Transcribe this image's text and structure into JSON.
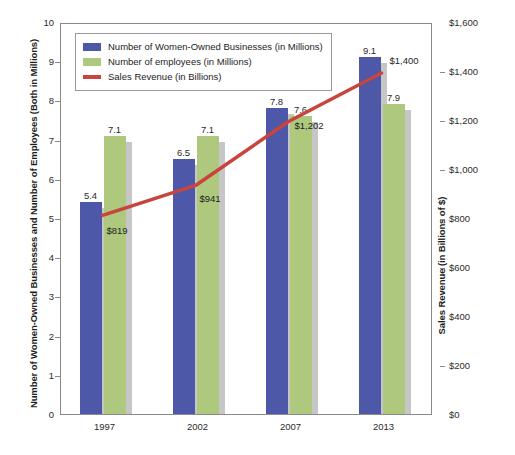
{
  "chart_data": {
    "type": "bar",
    "title": "",
    "categories": [
      "1997",
      "2002",
      "2007",
      "2013"
    ],
    "series": [
      {
        "name": "Number of Women-Owned Businesses (in Millions)",
        "type": "bar",
        "axis": "left",
        "color": "#4d58a8",
        "values": [
          5.4,
          6.5,
          7.8,
          9.1
        ],
        "labels": [
          "5.4",
          "6.5",
          "7.8",
          "9.1"
        ]
      },
      {
        "name": "Number of employees (in Millions)",
        "type": "bar",
        "axis": "left",
        "color": "#aec87e",
        "values": [
          7.1,
          7.1,
          7.6,
          7.9
        ],
        "labels": [
          "7.1",
          "7.1",
          "7.6",
          "7.9"
        ]
      },
      {
        "name": "Sales Revenue (in Billions)",
        "type": "line",
        "axis": "right",
        "color": "#c8443c",
        "values": [
          819,
          941,
          1202,
          1400
        ],
        "labels": [
          "$819",
          "$941",
          "$1,202",
          "$1,400"
        ]
      }
    ],
    "xlabel": "",
    "ylabel": "Number of Women-Owned Businesses and Number of Employees (Both in Millions)",
    "y2label": "Sales Revenue (in Billions of $)",
    "ylim": [
      0,
      10
    ],
    "y2lim": [
      0,
      1600
    ],
    "yticks": [
      "0",
      "1",
      "2",
      "3",
      "4",
      "5",
      "6",
      "7",
      "8",
      "9",
      "10"
    ],
    "y2ticks": [
      "$0",
      "$200",
      "$400",
      "$600",
      "$800",
      "$1,000",
      "$1,200",
      "$1,400",
      "$1,600"
    ],
    "grid": false,
    "legend_position": "top-left"
  },
  "legend": {
    "items": [
      {
        "label": "Number of Women-Owned Businesses (in Millions)",
        "color": "#4d58a8",
        "marker": "square"
      },
      {
        "label": "Number of employees (in Millions)",
        "color": "#aec87e",
        "marker": "square"
      },
      {
        "label": "Sales Revenue (in Billions)",
        "color": "#c8443c",
        "marker": "line"
      }
    ]
  }
}
